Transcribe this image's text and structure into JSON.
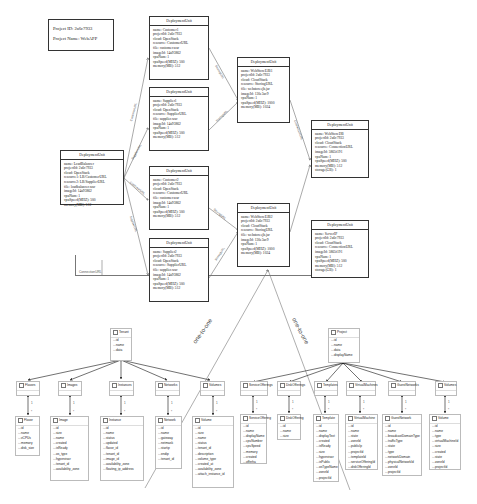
{
  "project": {
    "id_label": "Project ID: 2a6c7933",
    "name_label": "Project Name: WebAPP"
  },
  "deployment_units": [
    {
      "title": "DeploymentUnit",
      "lines": [
        "name: LoadBalancer",
        "projectId: 2a6c7933",
        "cloud: OpenStack",
        "resource1: LB/CustomerURL",
        "resource2: LB/SupplierURL",
        "file: loadbalancer.war",
        "imageId: 14a93862",
        "cpuNum: 1",
        "cpuSpeed(MHZ): 500",
        "memory(MB): 512"
      ]
    },
    {
      "title": "DeploymentUnit",
      "lines": [
        "name: Customer1",
        "projectId: 2a6c7933",
        "cloud: OpenStack",
        "resource: CustomerURL",
        "file: customer.war",
        "imageId: 14a93862",
        "cpuNum: 1",
        "cpuSpeed(MHZ): 500",
        "memory(MB): 512"
      ]
    },
    {
      "title": "DeploymentUnit",
      "lines": [
        "name: Supplier1",
        "projectId: 2a6c7933",
        "cloud: OpenStack",
        "resource: SupplierURL",
        "file: supplier.war",
        "imageId: 14a93862",
        "cpuNum: 1",
        "cpuSpeed(MHZ): 500",
        "memory(MB): 512"
      ]
    },
    {
      "title": "DeploymentUnit",
      "lines": [
        "name: Customer2",
        "projectId: 2a6c7933",
        "cloud: OpenStack",
        "resource: CustomerURL",
        "file: customer.war",
        "imageId: 14a93862",
        "cpuNum: 1",
        "cpuSpeed(MHZ): 500",
        "memory(MB): 512"
      ]
    },
    {
      "title": "DeploymentUnit",
      "lines": [
        "name: Supplier2",
        "projectId: 2a6c7933",
        "cloud: OpenStack",
        "resource: SupplierURL",
        "file: supplier.war",
        "imageId: 14a93862",
        "cpuNum: 1",
        "cpuSpeed(MHZ): 500",
        "memory(MB): 512"
      ]
    },
    {
      "title": "DeploymentUnit",
      "lines": [
        "name: WebStoreEJB1",
        "projectId: 2a6c7933",
        "cloud: CloudStack",
        "resource: StoringURL",
        "file: webstoreejb.jar",
        "imageId: 130e3ac9",
        "cpuNum: 1",
        "cpuSpeed(MHZ): 1000",
        "memory(MB): 1024"
      ]
    },
    {
      "title": "DeploymentUnit",
      "lines": [
        "name: WebStoreEJB2",
        "projectId: 2a6c7933",
        "cloud: CloudStack",
        "resource: StoringURL",
        "file: webstoreejb.jar",
        "imageId: 130e3ac9",
        "cpuNum: 1",
        "cpuSpeed(MHZ): 1000",
        "memory(MB): 1024"
      ]
    },
    {
      "title": "DeploymentUnit",
      "lines": [
        "name: WebStoreDB",
        "projectId: 2a6c7933",
        "cloud: CloudStack",
        "resource: ConnectionURL",
        "imageId: 5865f191",
        "cpuNum: 1",
        "cpuSpeed(MHZ): 500",
        "memory(MB): 512",
        "storage(GB): 1"
      ]
    },
    {
      "title": "DeploymentUnit",
      "lines": [
        "name: ServerIP",
        "projectId: 2a6c7933",
        "cloud: CloudStack",
        "resource: ConnectionURL",
        "imageId: 5865f191",
        "cpuNum: 1",
        "cpuSpeed(MHZ): 500",
        "memory(MB): 512",
        "storage(GB): 1"
      ]
    }
  ],
  "edge_labels": {
    "customer_url_1": "CustomerURL",
    "supplier_url_1": "SupplierURL",
    "customer_url_2": "CustomerURL",
    "supplier_url_2": "SupplierURL",
    "storing_url_1": "StoringURL",
    "storing_url_2": "StoringURL",
    "storing_url_3": "StoringURL",
    "storing_url_4": "StoringURL",
    "connection_url_1": "ConnectionURL",
    "connection_url_bottom": "ConnectionURL",
    "one_to_one_left": "one-to-one",
    "one_to_one_right": "one-to-one"
  },
  "openstack": {
    "root": {
      "name": "Tenant",
      "fields": [
        "id",
        "name",
        "data"
      ]
    },
    "collections": [
      "Flavors",
      "Images",
      "Instances",
      "Networks",
      "Volumes"
    ],
    "entities": [
      {
        "name": "Flavor",
        "fields": [
          "id",
          "name",
          "vCPUs",
          "memory",
          "disk_size"
        ]
      },
      {
        "name": "Image",
        "fields": [
          "id",
          "size",
          "name",
          "created",
          "isReady",
          "os_type",
          "hypervisor",
          "tenant_id",
          "availability_zone"
        ]
      },
      {
        "name": "Instance",
        "fields": [
          "id",
          "name",
          "status",
          "updated",
          "flavor_id",
          "tenant_id",
          "image_id",
          "availability_zone",
          "floating_ip_address"
        ]
      },
      {
        "name": "Network",
        "fields": [
          "id",
          "name",
          "gateway",
          "netmask",
          "startip",
          "endip",
          "tenant_id"
        ]
      },
      {
        "name": "Volume",
        "fields": [
          "id",
          "size",
          "name",
          "status",
          "tenant_id",
          "description",
          "volume_type",
          "created_at",
          "availability_zone",
          "attach_instance_id"
        ]
      }
    ]
  },
  "cloudstack": {
    "root": {
      "name": "Project",
      "fields": [
        "id",
        "name",
        "data",
        "displayName"
      ]
    },
    "collections": [
      "ServiceOfferings",
      "DiskOfferings",
      "Templates",
      "VirtualMachines",
      "GuestNetworks",
      "Volumes"
    ],
    "entities": [
      {
        "name": "ServiceOffering",
        "fields": [
          "id",
          "name",
          "displayName",
          "cpuNumber",
          "cpuSpeed",
          "memory",
          "created",
          "offerha"
        ]
      },
      {
        "name": "DiskOffering",
        "fields": [
          "id",
          "name",
          "size"
        ]
      },
      {
        "name": "Template",
        "fields": [
          "id",
          "name",
          "displayText",
          "created",
          "isReady",
          "size",
          "hypervisor",
          "isPublic",
          "osTypeName",
          "zoneId",
          "projectId"
        ]
      },
      {
        "name": "VirtualMachine",
        "fields": [
          "id",
          "name",
          "state",
          "zoneId",
          "publicIp",
          "projectId",
          "templateId",
          "serviceOfferingId",
          "diskOfferingId"
        ]
      },
      {
        "name": "GuestNetwork",
        "fields": [
          "id",
          "name",
          "broadcastDomainType",
          "trafficType",
          "state",
          "type",
          "networkDomain",
          "physicalNetworkId",
          "zoneId",
          "projectId"
        ]
      },
      {
        "name": "Volume",
        "fields": [
          "id",
          "name",
          "type",
          "virtualMachineId",
          "size",
          "created",
          "state",
          "zoneId",
          "projectId"
        ]
      }
    ]
  },
  "multiplicity": {
    "one": "1",
    "many": "*"
  }
}
